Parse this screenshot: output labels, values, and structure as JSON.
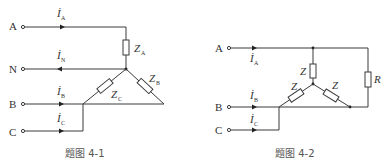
{
  "figures": [
    {
      "caption": "题图 4-1",
      "terminals": [
        "A",
        "N",
        "B",
        "C"
      ],
      "currents": [
        {
          "symbol": "İ",
          "sub": "A",
          "direction": "right"
        },
        {
          "symbol": "İ",
          "sub": "N",
          "direction": "left"
        },
        {
          "symbol": "İ",
          "sub": "B",
          "direction": "right"
        },
        {
          "symbol": "İ",
          "sub": "C",
          "direction": "right"
        }
      ],
      "impedances": [
        {
          "symbol": "Z",
          "sub": "A"
        },
        {
          "symbol": "Z",
          "sub": "B"
        },
        {
          "symbol": "Z",
          "sub": "C"
        }
      ]
    },
    {
      "caption": "题图 4-2",
      "terminals": [
        "A",
        "B",
        "C"
      ],
      "currents": [
        {
          "symbol": "İ",
          "sub": "A",
          "direction": "right"
        },
        {
          "symbol": "İ",
          "sub": "B",
          "direction": "right"
        },
        {
          "symbol": "İ",
          "sub": "C",
          "direction": "right"
        }
      ],
      "impedances": [
        {
          "symbol": "Z",
          "sub": ""
        },
        {
          "symbol": "Z",
          "sub": ""
        },
        {
          "symbol": "Z",
          "sub": ""
        }
      ],
      "resistor": {
        "symbol": "R"
      }
    }
  ]
}
